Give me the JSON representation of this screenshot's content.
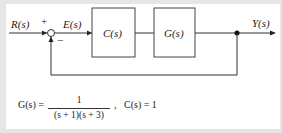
{
  "diagram": {
    "signals": {
      "input": "R(s)",
      "error": "E(s)",
      "output": "Y(s)"
    },
    "summing_junction": {
      "plus": "+",
      "minus": "−"
    },
    "blocks": [
      {
        "label": "C(s)"
      },
      {
        "label": "G(s)"
      }
    ],
    "feedback": "unity negative feedback"
  },
  "equation": {
    "g_lhs": "G(s) =",
    "g_numerator": "1",
    "g_denominator": "(s + 1)(s + 3)",
    "separator": ",",
    "c_def": "C(s) = 1"
  },
  "colors": {
    "background": "#e6e6e6",
    "panel": "#ffffff",
    "line": "#333333"
  }
}
